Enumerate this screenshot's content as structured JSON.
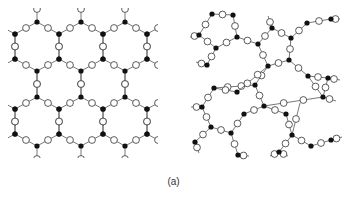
{
  "figure": {
    "caption": "(a)",
    "colors": {
      "edge": "#555555",
      "black_node": "#111111",
      "white_node_fill": "#ffffff",
      "white_node_stroke": "#333333"
    },
    "node_radius": {
      "black": 2.6,
      "white": 3.4
    },
    "panels": [
      {
        "name": "ordered-hexagonal-network",
        "description": "Regular honeycomb lattice: black 3-connected vertices linked by edges each carrying one white node",
        "lattice": {
          "hex_width": 44,
          "col_x0": 15,
          "row_tops": [
            22,
            97
          ],
          "hex_height_offsets": {
            "upper_side": 12,
            "lower_side": 37,
            "bottom": 49
          },
          "columns": 3,
          "clip": {
            "x0": 8,
            "x1": 158,
            "y0": 8,
            "y1": 158
          }
        }
      },
      {
        "name": "disordered-random-network",
        "description": "Continuous random network of black 3-connected nodes and white bridging nodes",
        "black_nodes": [
          [
            212,
            14
          ],
          [
            233,
            15
          ],
          [
            199,
            35
          ],
          [
            237,
            37
          ],
          [
            216,
            48
          ],
          [
            258,
            44
          ],
          [
            207,
            65
          ],
          [
            272,
            28
          ],
          [
            291,
            38
          ],
          [
            307,
            23
          ],
          [
            331,
            19
          ],
          [
            289,
            60
          ],
          [
            268,
            66
          ],
          [
            308,
            76
          ],
          [
            328,
            78
          ],
          [
            255,
            85
          ],
          [
            323,
            97
          ],
          [
            214,
            88
          ],
          [
            237,
            92
          ],
          [
            202,
            107
          ],
          [
            264,
            106
          ],
          [
            211,
            127
          ],
          [
            231,
            133
          ],
          [
            244,
            114
          ],
          [
            286,
            114
          ],
          [
            195,
            142
          ],
          [
            238,
            155
          ],
          [
            292,
            135
          ],
          [
            311,
            146
          ],
          [
            279,
            152
          ],
          [
            331,
            140
          ]
        ],
        "edges": [
          [
            0,
            1
          ],
          [
            0,
            2
          ],
          [
            1,
            3
          ],
          [
            2,
            4
          ],
          [
            3,
            4
          ],
          [
            3,
            5
          ],
          [
            4,
            6
          ],
          [
            5,
            7
          ],
          [
            7,
            8
          ],
          [
            5,
            12
          ],
          [
            8,
            9
          ],
          [
            9,
            10
          ],
          [
            8,
            11
          ],
          [
            11,
            12
          ],
          [
            11,
            13
          ],
          [
            13,
            14
          ],
          [
            12,
            15
          ],
          [
            15,
            17
          ],
          [
            17,
            18
          ],
          [
            18,
            12
          ],
          [
            13,
            16
          ],
          [
            16,
            20
          ],
          [
            14,
            16
          ],
          [
            15,
            20
          ],
          [
            17,
            19
          ],
          [
            19,
            21
          ],
          [
            21,
            22
          ],
          [
            22,
            23
          ],
          [
            23,
            20
          ],
          [
            20,
            24
          ],
          [
            24,
            27
          ],
          [
            27,
            28
          ],
          [
            28,
            30
          ],
          [
            27,
            29
          ],
          [
            22,
            26
          ],
          [
            21,
            25
          ]
        ],
        "stubs": [
          [
            207,
            65,
            196,
            62
          ],
          [
            199,
            35,
            190,
            37
          ],
          [
            272,
            28,
            268,
            16
          ],
          [
            331,
            19,
            340,
            19
          ],
          [
            195,
            142,
            199,
            153
          ],
          [
            202,
            107,
            191,
            107
          ],
          [
            238,
            155,
            249,
            156
          ],
          [
            279,
            152,
            270,
            156
          ],
          [
            279,
            152,
            288,
            156
          ],
          [
            331,
            140,
            342,
            137
          ],
          [
            328,
            78,
            340,
            80
          ],
          [
            323,
            97,
            336,
            101
          ],
          [
            292,
            135,
            300,
            103
          ]
        ]
      }
    ]
  }
}
